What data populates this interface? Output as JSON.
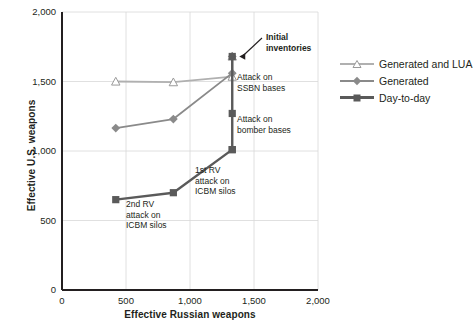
{
  "chart_data": {
    "type": "line",
    "title": "",
    "xlabel": "Effective Russian weapons",
    "ylabel": "Effective U.S. weapons",
    "xlim": [
      0,
      2000
    ],
    "ylim": [
      0,
      2000
    ],
    "xticks": [
      "0",
      "500",
      "1,000",
      "1,500",
      "2,000"
    ],
    "xtick_values": [
      0,
      500,
      1000,
      1500,
      2000
    ],
    "yticks": [
      "0",
      "500",
      "1,000",
      "1,500",
      "2,000"
    ],
    "ytick_values": [
      0,
      500,
      1000,
      1500,
      2000
    ],
    "grid": true,
    "legend_position": "right",
    "series": [
      {
        "name": "Generated and LUA",
        "color": "#b0b0b0",
        "marker": "triangle",
        "x": [
          1330,
          1330,
          870,
          420
        ],
        "y": [
          1680,
          1535,
          1495,
          1500
        ]
      },
      {
        "name": "Generated",
        "color": "#8a8a8a",
        "marker": "diamond",
        "x": [
          1330,
          1330,
          870,
          420
        ],
        "y": [
          1680,
          1560,
          1230,
          1165
        ]
      },
      {
        "name": "Day-to-day",
        "color": "#5a5a5a",
        "marker": "square",
        "x": [
          1330,
          1330,
          1330,
          1330,
          870,
          420
        ],
        "y": [
          1680,
          1270,
          1010,
          1010,
          700,
          650
        ]
      }
    ],
    "annotations": [
      {
        "text": "Initial\ninventories",
        "bold": true,
        "x": 266,
        "y": 32
      },
      {
        "text": "Attack on\nSSBN bases",
        "bold": false,
        "x": 237,
        "y": 72
      },
      {
        "text": "Attack on\nbomber bases",
        "bold": false,
        "x": 237,
        "y": 114
      },
      {
        "text": "1st RV\nattack on\nICBM silos",
        "bold": false,
        "x": 195,
        "y": 165
      },
      {
        "text": "2nd RV\nattack on\nICBM silos",
        "bold": false,
        "x": 126,
        "y": 199
      }
    ]
  },
  "legend": {
    "items": [
      {
        "label": "Generated and LUA"
      },
      {
        "label": "Generated"
      },
      {
        "label": "Day-to-day"
      }
    ]
  },
  "colors": {
    "generated_and_lua": "#b0b0b0",
    "generated": "#8a8a8a",
    "day_to_day": "#5a5a5a",
    "axis": "#231f20",
    "grid": "#d8d8d8",
    "background": "#ffffff"
  }
}
